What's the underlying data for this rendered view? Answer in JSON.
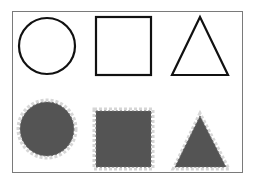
{
  "figure": {
    "frame_color": "#7a7a7a",
    "background": "#ffffff",
    "rows": [
      {
        "name": "outline-row",
        "style": "outline",
        "stroke": "#111111",
        "shapes": [
          {
            "type": "circle",
            "label": "outline-circle"
          },
          {
            "type": "square",
            "label": "outline-square"
          },
          {
            "type": "triangle",
            "label": "outline-triangle"
          }
        ]
      },
      {
        "name": "filled-row",
        "style": "filled-with-dashed-halo",
        "fill": "#545454",
        "halo": "#d6d6d6",
        "shapes": [
          {
            "type": "circle",
            "label": "filled-circle"
          },
          {
            "type": "square",
            "label": "filled-square"
          },
          {
            "type": "triangle",
            "label": "filled-triangle"
          }
        ]
      }
    ]
  }
}
